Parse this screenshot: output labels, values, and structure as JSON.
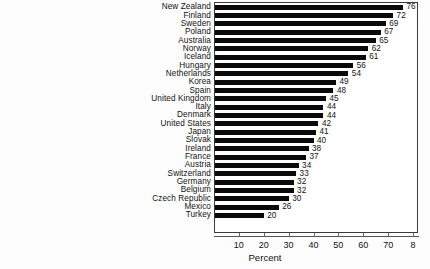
{
  "chart_data": {
    "type": "bar",
    "orientation": "horizontal",
    "title": "",
    "xlabel": "Percent",
    "ylabel": "",
    "xlim": [
      0,
      82
    ],
    "xticks": [
      10,
      20,
      30,
      40,
      50,
      60,
      70,
      80
    ],
    "xtick_labels": [
      "10",
      "20",
      "30",
      "40",
      "50",
      "60",
      "70",
      "8"
    ],
    "grid": false,
    "legend": null,
    "bar_color": "#0a0a0a",
    "value_labels_shown": true,
    "categories": [
      "New Zealand",
      "Finland",
      "Sweden",
      "Poland",
      "Australia",
      "Norway",
      "Iceland",
      "Hungary",
      "Netherlands",
      "Korea",
      "Spain",
      "United Kingdom",
      "Italy",
      "Denmark",
      "United States",
      "Japan",
      "Slovak",
      "Ireland",
      "France",
      "Austria",
      "Switzerland",
      "Germany",
      "Belgium",
      "Czech Republic",
      "Mexico",
      "Turkey"
    ],
    "values": [
      76,
      72,
      69,
      67,
      65,
      62,
      61,
      56,
      54,
      49,
      48,
      45,
      44,
      44,
      42,
      41,
      40,
      38,
      37,
      34,
      33,
      32,
      32,
      30,
      26,
      20
    ]
  }
}
